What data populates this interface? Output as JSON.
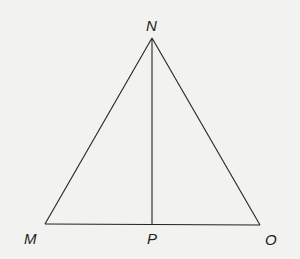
{
  "diagram": {
    "type": "triangle",
    "colors": {
      "background": "#f2f2f0",
      "stroke": "#222222",
      "label": "#222222"
    },
    "points": {
      "N": {
        "label": "N",
        "x": 152,
        "y": 38
      },
      "M": {
        "label": "M",
        "x": 45,
        "y": 224
      },
      "O": {
        "label": "O",
        "x": 260,
        "y": 225
      },
      "P": {
        "label": "P",
        "x": 152,
        "y": 224
      }
    },
    "segments": [
      {
        "from": "N",
        "to": "M"
      },
      {
        "from": "N",
        "to": "O"
      },
      {
        "from": "M",
        "to": "O"
      },
      {
        "from": "N",
        "to": "P"
      }
    ]
  }
}
